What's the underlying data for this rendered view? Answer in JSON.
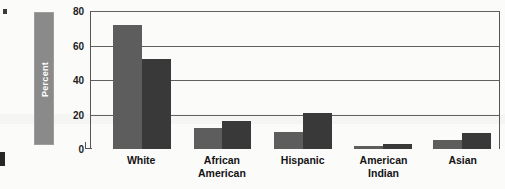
{
  "chart_data": {
    "type": "bar",
    "title": "",
    "xlabel": "",
    "ylabel": "Percent",
    "ylim": [
      0,
      80
    ],
    "yticks": [
      0,
      20,
      40,
      60,
      80
    ],
    "ytick_labels": [
      "0",
      "20",
      "40",
      "60",
      "80"
    ],
    "grid": true,
    "legend": "none",
    "categories": [
      "White",
      "African American",
      "Hispanic",
      "American Indian",
      "Asian"
    ],
    "category_lines": [
      [
        "White"
      ],
      [
        "African",
        "American"
      ],
      [
        "Hispanic"
      ],
      [
        "American",
        "Indian"
      ],
      [
        "Asian"
      ]
    ],
    "series": [
      {
        "name": "series-a",
        "color": "#5d5d5d",
        "values": [
          72,
          12,
          10,
          2,
          5
        ]
      },
      {
        "name": "series-b",
        "color": "#393939",
        "values": [
          52,
          16,
          21,
          3,
          9
        ]
      }
    ]
  },
  "axis": {
    "y_title": "Percent",
    "y_title_bg": "#8a8a8a",
    "y_title_color": "#ffffff"
  },
  "colors": {
    "series_a": "#5d5d5d",
    "series_b": "#393939",
    "gridline": "#606060",
    "axis": "#555555",
    "text": "#141414",
    "page_background": "#fbfbfa"
  }
}
